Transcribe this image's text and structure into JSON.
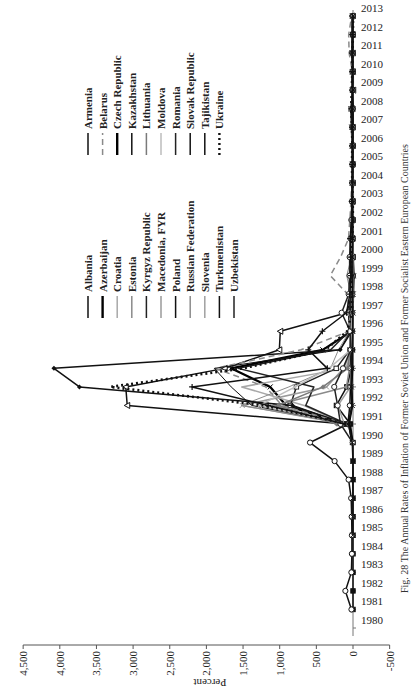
{
  "caption": "Fig. 28  The Annual Rates of Inflation of Former Soviet Union and Former Socialist Eastern European Countries",
  "chart_data": {
    "type": "line",
    "title": "",
    "xlabel": "",
    "ylabel": "Percent",
    "ylim": [
      -500,
      4500
    ],
    "yticks": [
      -500,
      0,
      500,
      1000,
      1500,
      2000,
      2500,
      3000,
      3500,
      4000,
      4500
    ],
    "ytick_labels": [
      "-500",
      "0",
      "500",
      "1,000",
      "1,500",
      "2,000",
      "2,500",
      "3,000",
      "3,500",
      "4,000",
      "4,500"
    ],
    "grid": false,
    "legend_position": "upper-left (two columns)",
    "rotated": "chart rendered rotated 90 degrees counter-clockwise on the page",
    "categories": [
      "1980",
      "1981",
      "1982",
      "1983",
      "1984",
      "1985",
      "1986",
      "1987",
      "1988",
      "1989",
      "1990",
      "1991",
      "1992",
      "1993",
      "1994",
      "1995",
      "1996",
      "1997",
      "1998",
      "1999",
      "2000",
      "2001",
      "2002",
      "2003",
      "2004",
      "2005",
      "2006",
      "2007",
      "2008",
      "2009",
      "2010",
      "2011",
      "2012",
      "2013"
    ],
    "series": [
      {
        "name": "Albania",
        "style": "solid-black-square",
        "color": "#111111",
        "dash": "",
        "values": [
          null,
          0,
          0,
          0,
          0,
          0,
          0,
          0,
          0,
          0,
          0,
          36,
          226,
          85,
          22,
          8,
          13,
          33,
          21,
          0,
          0,
          3,
          5,
          2,
          3,
          2,
          2,
          3,
          3,
          2,
          4,
          3,
          2,
          2
        ]
      },
      {
        "name": "Azerbaijan",
        "style": "solid-black-bold-cross",
        "color": "#000000",
        "dash": "",
        "values": [
          null,
          null,
          null,
          null,
          null,
          null,
          null,
          null,
          null,
          null,
          null,
          107,
          912,
          1129,
          1664,
          412,
          20,
          4,
          -1,
          -9,
          2,
          2,
          3,
          2,
          7,
          10,
          8,
          17,
          21,
          2,
          6,
          8,
          1,
          2
        ]
      },
      {
        "name": "Croatia",
        "style": "solid-light-gray",
        "color": "#a8a8a8",
        "dash": "",
        "values": [
          null,
          null,
          null,
          null,
          null,
          null,
          null,
          null,
          null,
          null,
          null,
          123,
          666,
          1518,
          98,
          2,
          4,
          4,
          6,
          4,
          5,
          5,
          2,
          2,
          2,
          3,
          3,
          3,
          6,
          2,
          1,
          2,
          3,
          2
        ]
      },
      {
        "name": "Estonia",
        "style": "solid-gray-diamond",
        "color": "#8a8a8a",
        "dash": "",
        "values": [
          null,
          null,
          null,
          null,
          null,
          null,
          null,
          null,
          null,
          null,
          null,
          211,
          1076,
          90,
          48,
          29,
          23,
          11,
          8,
          3,
          4,
          6,
          4,
          1,
          3,
          4,
          4,
          7,
          10,
          0,
          3,
          5,
          4,
          3
        ]
      },
      {
        "name": "Kyrgyz Republic",
        "style": "solid-black-open-square",
        "color": "#222222",
        "dash": "",
        "values": [
          null,
          null,
          null,
          null,
          null,
          null,
          null,
          null,
          null,
          null,
          null,
          85,
          855,
          772,
          229,
          41,
          31,
          26,
          12,
          36,
          19,
          7,
          2,
          3,
          4,
          4,
          6,
          10,
          25,
          7,
          8,
          17,
          3,
          7
        ]
      },
      {
        "name": "Macedonia, FYR",
        "style": "solid-gray-cross",
        "color": "#9a9a9a",
        "dash": "",
        "values": [
          null,
          null,
          null,
          null,
          null,
          null,
          null,
          null,
          null,
          null,
          null,
          115,
          1511,
          362,
          128,
          16,
          3,
          1,
          1,
          -1,
          6,
          5,
          2,
          1,
          0,
          0,
          3,
          2,
          8,
          -1,
          2,
          4,
          3,
          3
        ]
      },
      {
        "name": "Poland",
        "style": "solid-black-open-circle",
        "color": "#111111",
        "dash": "",
        "values": [
          null,
          21,
          104,
          22,
          15,
          15,
          18,
          25,
          60,
          251,
          586,
          70,
          43,
          35,
          32,
          28,
          20,
          15,
          12,
          7,
          10,
          6,
          2,
          1,
          4,
          2,
          1,
          3,
          4,
          4,
          3,
          4,
          4,
          1
        ]
      },
      {
        "name": "Russian Federation",
        "style": "solid-gray-thin",
        "color": "#8c8c8c",
        "dash": "",
        "values": [
          null,
          null,
          null,
          null,
          null,
          null,
          null,
          null,
          null,
          null,
          null,
          93,
          1526,
          875,
          307,
          198,
          48,
          15,
          28,
          86,
          21,
          22,
          16,
          14,
          11,
          13,
          10,
          9,
          14,
          12,
          7,
          8,
          5,
          7
        ]
      },
      {
        "name": "Slovenia",
        "style": "solid-gray-asterisk",
        "color": "#a0a0a0",
        "dash": "",
        "values": [
          null,
          null,
          null,
          null,
          null,
          null,
          null,
          null,
          null,
          null,
          null,
          118,
          207,
          33,
          21,
          13,
          10,
          8,
          8,
          6,
          9,
          8,
          8,
          6,
          4,
          3,
          2,
          4,
          6,
          1,
          2,
          2,
          3,
          2
        ]
      },
      {
        "name": "Turkmenistan",
        "style": "solid-black-open-triangle",
        "color": "#111111",
        "dash": "",
        "values": [
          null,
          null,
          null,
          null,
          null,
          null,
          null,
          null,
          null,
          null,
          null,
          103,
          3080,
          3100,
          1750,
          1005,
          992,
          84,
          17,
          24,
          8,
          12,
          9,
          6,
          6,
          11,
          8,
          6,
          15,
          -3,
          4,
          5,
          5,
          7
        ]
      },
      {
        "name": "Uzbekistan",
        "style": "solid-black-small-marker",
        "color": "#222222",
        "dash": "",
        "values": [
          null,
          null,
          null,
          null,
          null,
          null,
          null,
          null,
          null,
          null,
          null,
          82,
          645,
          534,
          1568,
          305,
          54,
          59,
          18,
          29,
          25,
          27,
          27,
          12,
          7,
          10,
          14,
          12,
          13,
          12,
          12,
          12,
          11,
          11
        ]
      },
      {
        "name": "Armenia",
        "style": "solid-black-diamond",
        "color": "#111111",
        "dash": "",
        "values": [
          null,
          null,
          null,
          null,
          null,
          null,
          null,
          null,
          null,
          null,
          null,
          100,
          825,
          3732,
          4080,
          176,
          19,
          14,
          9,
          1,
          -1,
          3,
          1,
          5,
          7,
          1,
          3,
          5,
          9,
          3,
          8,
          8,
          3,
          6
        ]
      },
      {
        "name": "Belarus",
        "style": "dashed-gray",
        "color": "#8a8a8a",
        "dash": "6,4",
        "values": [
          null,
          null,
          null,
          null,
          null,
          null,
          null,
          null,
          null,
          null,
          null,
          94,
          971,
          1190,
          1880,
          709,
          53,
          64,
          73,
          310,
          169,
          61,
          43,
          28,
          18,
          10,
          7,
          8,
          15,
          13,
          8,
          53,
          59,
          18
        ]
      },
      {
        "name": "Czech Republic",
        "style": "solid-black-bold",
        "color": "#000000",
        "dash": "",
        "values": [
          null,
          null,
          null,
          null,
          null,
          null,
          null,
          null,
          null,
          null,
          10,
          56,
          11,
          21,
          10,
          9,
          9,
          8,
          11,
          2,
          4,
          5,
          2,
          0,
          3,
          2,
          3,
          3,
          6,
          1,
          1,
          2,
          3,
          1
        ]
      },
      {
        "name": "Kazakhstan",
        "style": "solid-black-thin",
        "color": "#111111",
        "dash": "",
        "values": [
          null,
          null,
          null,
          null,
          null,
          null,
          null,
          null,
          null,
          null,
          null,
          79,
          1381,
          1662,
          1892,
          176,
          39,
          17,
          7,
          8,
          13,
          8,
          6,
          6,
          7,
          8,
          9,
          11,
          17,
          7,
          7,
          8,
          5,
          6
        ]
      },
      {
        "name": "Lithuania",
        "style": "solid-gray-diamond",
        "color": "#7a7a7a",
        "dash": "",
        "values": [
          null,
          null,
          null,
          null,
          null,
          null,
          null,
          null,
          null,
          null,
          null,
          225,
          1021,
          410,
          72,
          40,
          25,
          9,
          5,
          1,
          1,
          2,
          0,
          -1,
          1,
          3,
          4,
          6,
          11,
          4,
          1,
          4,
          3,
          1
        ]
      },
      {
        "name": "Moldova",
        "style": "solid-light-gray-cross",
        "color": "#bdbdbd",
        "dash": "",
        "values": [
          null,
          null,
          null,
          null,
          null,
          null,
          null,
          null,
          null,
          null,
          null,
          98,
          1276,
          789,
          330,
          30,
          24,
          12,
          8,
          39,
          31,
          10,
          5,
          12,
          12,
          12,
          13,
          12,
          13,
          0,
          7,
          8,
          5,
          5
        ]
      },
      {
        "name": "Romania",
        "style": "solid-black-open-circle",
        "color": "#222222",
        "dash": "",
        "values": [
          null,
          null,
          null,
          null,
          null,
          null,
          null,
          null,
          null,
          null,
          5,
          170,
          210,
          256,
          137,
          32,
          39,
          155,
          59,
          46,
          46,
          34,
          23,
          15,
          12,
          9,
          7,
          5,
          8,
          6,
          6,
          6,
          3,
          4
        ]
      },
      {
        "name": "Slovak Republic",
        "style": "solid-black-x",
        "color": "#111111",
        "dash": "",
        "values": [
          null,
          null,
          null,
          null,
          null,
          2,
          2,
          2,
          1,
          1,
          10,
          61,
          10,
          23,
          13,
          10,
          6,
          6,
          7,
          11,
          12,
          7,
          3,
          9,
          8,
          3,
          4,
          3,
          5,
          2,
          1,
          4,
          4,
          1
        ]
      },
      {
        "name": "Tajikistan",
        "style": "solid-black-plus",
        "color": "#111111",
        "dash": "",
        "values": [
          null,
          null,
          null,
          null,
          null,
          null,
          null,
          null,
          null,
          null,
          null,
          112,
          1157,
          2195,
          350,
          610,
          418,
          88,
          43,
          28,
          33,
          39,
          12,
          16,
          7,
          7,
          10,
          13,
          20,
          7,
          6,
          12,
          6,
          5
        ]
      },
      {
        "name": "Ukraine",
        "style": "dotted-black-bold",
        "color": "#111111",
        "dash": "2,3",
        "values": [
          null,
          null,
          null,
          null,
          null,
          null,
          null,
          null,
          null,
          null,
          null,
          91,
          1210,
          3310,
          1500,
          377,
          80,
          16,
          11,
          23,
          28,
          12,
          1,
          5,
          9,
          14,
          9,
          13,
          25,
          16,
          9,
          8,
          1,
          0
        ]
      }
    ]
  },
  "legend": {
    "column1": [
      "Albania",
      "Azerbaijan",
      "Croatia",
      "Estonia",
      "Kyrgyz Republic",
      "Macedonia, FYR",
      "Poland",
      "Russian Federation",
      "Slovenia",
      "Turkmenistan",
      "Uzbekistan"
    ],
    "column2": [
      "Armenia",
      "Belarus",
      "Czech Republic",
      "Kazakhstan",
      "Lithuania",
      "Moldova",
      "Romania",
      "Slovak Republic",
      "Tajikistan",
      "Ukraine"
    ]
  }
}
